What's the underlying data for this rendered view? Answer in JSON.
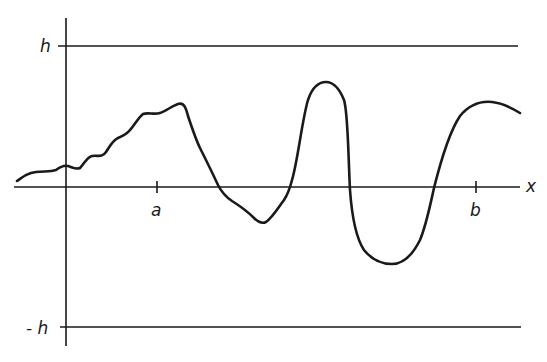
{
  "diagram": {
    "type": "function-plot",
    "labels": {
      "upper_bound": "h",
      "lower_bound": "- h",
      "x_axis": "x",
      "tick_a": "a",
      "tick_b": "b"
    },
    "colors": {
      "ink": "#1a1a1a",
      "background": "#ffffff"
    }
  }
}
